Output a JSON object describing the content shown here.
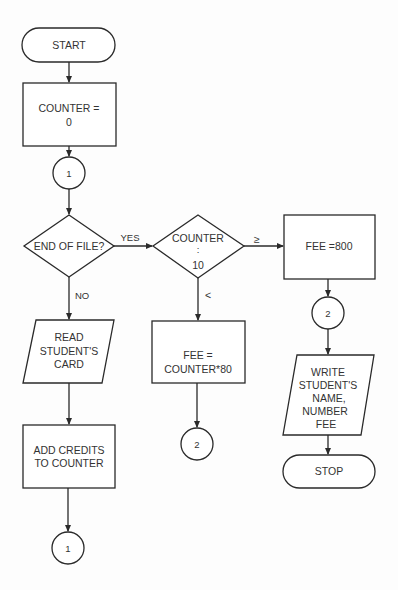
{
  "flowchart": {
    "nodes": [
      {
        "id": "start",
        "type": "terminal",
        "lines": [
          "START"
        ]
      },
      {
        "id": "init_counter",
        "type": "process",
        "lines": [
          "COUNTER =",
          "0"
        ]
      },
      {
        "id": "connector_1_top",
        "type": "connector",
        "lines": [
          "1"
        ]
      },
      {
        "id": "end_of_file",
        "type": "decision",
        "lines": [
          "END OF FILE?"
        ]
      },
      {
        "id": "read_card",
        "type": "input-output",
        "lines": [
          "READ",
          "STUDENT'S",
          "CARD"
        ]
      },
      {
        "id": "add_credits",
        "type": "process",
        "lines": [
          "ADD CREDITS",
          "TO COUNTER"
        ]
      },
      {
        "id": "connector_1_bottom",
        "type": "connector",
        "lines": [
          "1"
        ]
      },
      {
        "id": "counter_compare",
        "type": "decision",
        "lines": [
          "COUNTER",
          ":",
          "10"
        ]
      },
      {
        "id": "fee_counter",
        "type": "process",
        "lines": [
          "FEE =",
          "COUNTER*80"
        ]
      },
      {
        "id": "connector_2_mid",
        "type": "connector",
        "lines": [
          "2"
        ]
      },
      {
        "id": "fee_800",
        "type": "process",
        "lines": [
          "FEE =800"
        ]
      },
      {
        "id": "connector_2_right",
        "type": "connector",
        "lines": [
          "2"
        ]
      },
      {
        "id": "write_output",
        "type": "input-output",
        "lines": [
          "WRITE",
          "STUDENT'S",
          "NAME,",
          "NUMBER",
          "FEE"
        ]
      },
      {
        "id": "stop",
        "type": "terminal",
        "lines": [
          "STOP"
        ]
      }
    ],
    "edge_labels": {
      "yes": "YES",
      "no": "NO",
      "gte": "≥",
      "lt": "<"
    },
    "edges": [
      {
        "from": "start",
        "to": "init_counter"
      },
      {
        "from": "init_counter",
        "to": "connector_1_top"
      },
      {
        "from": "connector_1_top",
        "to": "end_of_file"
      },
      {
        "from": "end_of_file",
        "to": "counter_compare",
        "label": "YES"
      },
      {
        "from": "end_of_file",
        "to": "read_card",
        "label": "NO"
      },
      {
        "from": "read_card",
        "to": "add_credits"
      },
      {
        "from": "add_credits",
        "to": "connector_1_bottom"
      },
      {
        "from": "counter_compare",
        "to": "fee_800",
        "label": "≥"
      },
      {
        "from": "counter_compare",
        "to": "fee_counter",
        "label": "<"
      },
      {
        "from": "fee_counter",
        "to": "connector_2_mid"
      },
      {
        "from": "fee_800",
        "to": "connector_2_right"
      },
      {
        "from": "connector_2_right",
        "to": "write_output"
      },
      {
        "from": "write_output",
        "to": "stop"
      }
    ]
  }
}
